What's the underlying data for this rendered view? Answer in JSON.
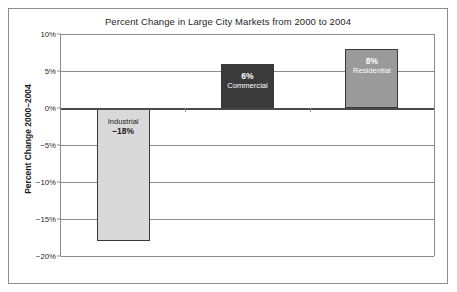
{
  "chart_data": {
    "type": "bar",
    "title": "Percent Change in Large City Markets from 2000 to 2004",
    "xlabel": "",
    "ylabel": "Percent Change 2000–2004",
    "categories": [
      "Industrial",
      "Commercial",
      "Residential"
    ],
    "values": [
      -18,
      6,
      8
    ],
    "value_labels": [
      "−18%",
      "6%",
      "8%"
    ],
    "ylim": [
      -20,
      10
    ],
    "ytick_values": [
      10,
      5,
      0,
      -5,
      -10,
      -15,
      -20
    ],
    "ytick_labels": [
      "10%",
      "5%",
      "0%",
      "−5%",
      "−10%",
      "−15%",
      "−20%"
    ],
    "grid": true,
    "legend": "none",
    "bar_colors": [
      "#d9d9d9",
      "#3a3a3a",
      "#9a9a9a"
    ],
    "bar_label_colors": [
      "#1b1b1b",
      "#ffffff",
      "#ffffff"
    ],
    "series": [
      {
        "name": "Percent Change",
        "points": [
          {
            "category": "Industrial",
            "value": -18,
            "label": "−18%",
            "fill": "#d9d9d9",
            "text_color": "#1b1b1b"
          },
          {
            "category": "Commercial",
            "value": 6,
            "label": "6%",
            "fill": "#3a3a3a",
            "text_color": "#ffffff"
          },
          {
            "category": "Residential",
            "value": 8,
            "label": "8%",
            "fill": "#9a9a9a",
            "text_color": "#ffffff"
          }
        ]
      }
    ]
  }
}
